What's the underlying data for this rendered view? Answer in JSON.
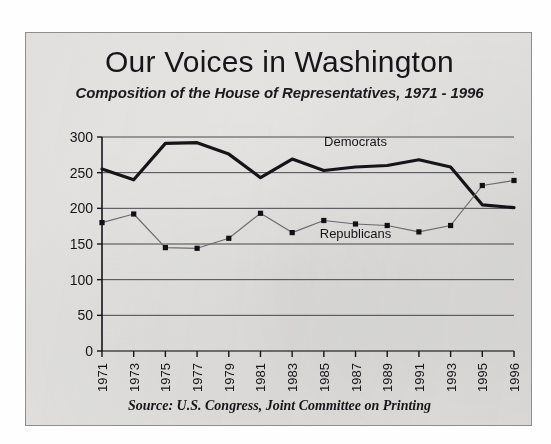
{
  "card": {
    "title": "Our Voices in Washington",
    "subtitle": "Composition of the House of Representatives, 1971 - 1996",
    "source": "Source:  U.S. Congress, Joint Committee on Printing"
  },
  "colors": {
    "paper": "#e4e3e1",
    "ink": "#15151a",
    "democrat_line": "#141419",
    "republican_line": "#6e6e72",
    "gridline": "#4a4a4e",
    "card_border": "#8f8e8c"
  },
  "chart_data": {
    "type": "line",
    "title": "Our Voices in Washington",
    "subtitle": "Composition of the House of Representatives, 1971 - 1996",
    "xlabel": "",
    "ylabel": "",
    "ylim": [
      0,
      300
    ],
    "yticks": [
      0,
      50,
      100,
      150,
      200,
      250,
      300
    ],
    "ytick_labels": [
      "0",
      "50",
      "100",
      "150",
      "200",
      "250",
      "300"
    ],
    "grid": true,
    "grid_axis": "y",
    "legend_position": "inline-annotation",
    "categories": [
      "1971",
      "1973",
      "1975",
      "1977",
      "1979",
      "1981",
      "1983",
      "1985",
      "1987",
      "1989",
      "1991",
      "1993",
      "1995",
      "1996"
    ],
    "series": [
      {
        "name": "Democrats",
        "values": [
          255,
          240,
          291,
          292,
          276,
          243,
          269,
          253,
          258,
          260,
          268,
          258,
          205,
          201
        ],
        "style": "thick-solid",
        "markers": false,
        "label_at_category": "1987",
        "label_y_value": 288
      },
      {
        "name": "Republicans",
        "values": [
          180,
          192,
          145,
          144,
          158,
          193,
          166,
          183,
          178,
          176,
          167,
          176,
          232,
          239
        ],
        "style": "thin-solid",
        "markers": true,
        "label_at_category": "1987",
        "label_y_value": 158
      }
    ],
    "annotations": [
      "Source:  U.S. Congress, Joint Committee on Printing"
    ]
  }
}
